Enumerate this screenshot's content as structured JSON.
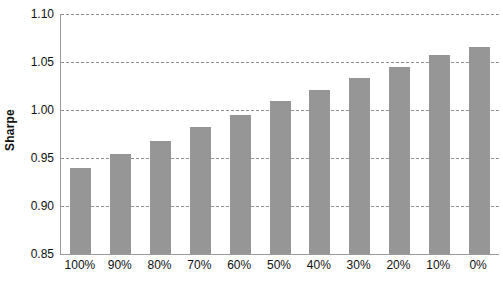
{
  "chart_data": {
    "type": "bar",
    "title": "",
    "subtitle": "",
    "xlabel": "",
    "ylabel": "Sharpe",
    "categories": [
      "100%",
      "90%",
      "80%",
      "70%",
      "60%",
      "50%",
      "40%",
      "30%",
      "20%",
      "10%",
      "0%"
    ],
    "values": [
      0.94,
      0.954,
      0.968,
      0.982,
      0.995,
      1.009,
      1.021,
      1.033,
      1.045,
      1.057,
      1.066
    ],
    "series": [
      {
        "name": "Sharpe",
        "values": [
          0.94,
          0.954,
          0.968,
          0.982,
          0.995,
          1.009,
          1.021,
          1.033,
          1.045,
          1.057,
          1.066
        ]
      }
    ],
    "ylim": [
      0.85,
      1.1
    ],
    "ytick_values": [
      0.85,
      0.9,
      0.95,
      1.0,
      1.05,
      1.1
    ],
    "ytick_labels": [
      "0.85",
      "0.90",
      "0.95",
      "1.00",
      "1.05",
      "1.10"
    ],
    "grid": true,
    "grid_axis": "y",
    "grid_style": "dashed",
    "legend": false,
    "legend_position": "none",
    "bar_color": "#969696",
    "grid_color": "#8f8f8f",
    "axis_color": "#9a9a9a",
    "text_color": "#111111",
    "background_color": "#ffffff",
    "annotations": []
  }
}
